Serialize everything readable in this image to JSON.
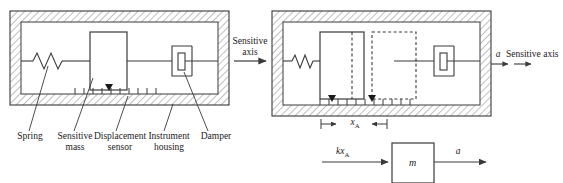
{
  "figure": {
    "type": "accelerometer-schematic"
  },
  "left_diagram": {
    "name": "accelerometer-at-rest",
    "components": [
      "spring",
      "sensitive-mass",
      "displacement-sensor",
      "instrument-housing",
      "damper"
    ],
    "callouts": [
      {
        "label_line1": "Spring",
        "label_line2": ""
      },
      {
        "label_line1": "Sensitive",
        "label_line2": "mass"
      },
      {
        "label_line1": "Displacement",
        "label_line2": "sensor"
      },
      {
        "label_line1": "Instrument",
        "label_line2": "housing"
      },
      {
        "label_line1": "Damper",
        "label_line2": ""
      }
    ]
  },
  "center_axis": {
    "label_line1": "Sensitive",
    "label_line2": "axis"
  },
  "right_diagram": {
    "name": "accelerometer-under-acceleration",
    "axis_symbol": "a",
    "axis_label": "Sensitive axis",
    "displacement_symbol": "x",
    "displacement_subscript": "A"
  },
  "free_body_diagram": {
    "name": "free-body-diagram",
    "force_symbol": "kx",
    "force_subscript": "A",
    "mass_symbol": "m",
    "accel_symbol": "a"
  },
  "style": {
    "line_color": "#3a3a3a",
    "hatch_color": "#888888",
    "housing_fill": "#ffffff",
    "text_color": "#1a1a1a"
  }
}
